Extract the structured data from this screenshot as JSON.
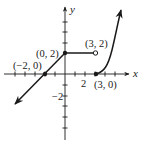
{
  "figure": {
    "type": "piecewise-function-graph",
    "axes": {
      "x_label": "x",
      "y_label": "y",
      "x_tick_label": "2",
      "y_tick_label": "−2"
    },
    "points": [
      {
        "label": "(−2, 0)",
        "x": -2,
        "y": 0,
        "style": "closed"
      },
      {
        "label": "(0, 2)",
        "x": 0,
        "y": 2,
        "style": "closed"
      },
      {
        "label": "(3, 2)",
        "x": 3,
        "y": 2,
        "style": "open"
      },
      {
        "label": "(3, 0)",
        "x": 3,
        "y": 0,
        "style": "closed"
      }
    ],
    "segments": [
      {
        "description": "line through (-2,0) to (0,2), arrow extending down-left",
        "type": "ray"
      },
      {
        "description": "horizontal segment from (0,2) closed to (3,2) open",
        "type": "segment"
      },
      {
        "description": "curve from (3,0) increasing upward, arrow up",
        "type": "curve"
      }
    ],
    "colors": {
      "stroke": "#1a1a1a",
      "background": "#ffffff"
    }
  }
}
